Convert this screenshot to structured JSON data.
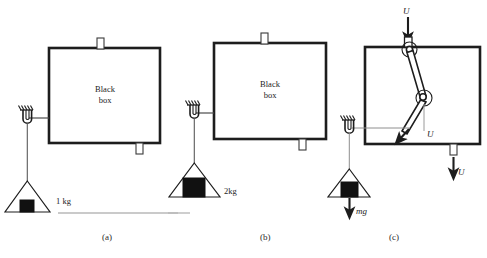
{
  "figure": {
    "background_color": "#ffffff",
    "ink_color": "#1d1d1d",
    "ground_color": "#b8b8b8",
    "width": 487,
    "height": 258
  },
  "panels": [
    {
      "id": "a",
      "caption": "(a)",
      "box_label_line1": "Black",
      "box_label_line2": "box",
      "hook_name": "ceiling-hook",
      "mass_label": "1 kg",
      "mass_size": "small",
      "has_ground_line": true,
      "forces": []
    },
    {
      "id": "b",
      "caption": "(b)",
      "box_label_line1": "Black",
      "box_label_line2": "box",
      "hook_name": "ceiling-hook",
      "mass_label": "2kg",
      "mass_size": "large",
      "has_ground_line": true,
      "forces": []
    },
    {
      "id": "c",
      "caption": "(c)",
      "box_label_line1": "",
      "box_label_line2": "",
      "hook_name": "ceiling-hook",
      "mass_label": "",
      "mass_size": "medium",
      "has_ground_line": false,
      "forces": [
        {
          "label": "U",
          "position": "top-input",
          "direction": "down"
        },
        {
          "label": "U",
          "position": "mid-linkage",
          "direction": "down-left"
        },
        {
          "label": "U",
          "position": "bottom-tab",
          "direction": "down"
        },
        {
          "label": "mg",
          "position": "hanging-mass",
          "direction": "down"
        }
      ],
      "linkage": {
        "bars": 2,
        "joints": 2,
        "description": "two pin-jointed bars inside box"
      }
    }
  ],
  "legend": {
    "weight_glyph": "black-square",
    "support_glyph": "hatched-ceiling"
  }
}
